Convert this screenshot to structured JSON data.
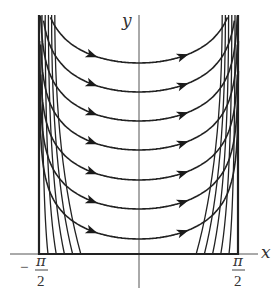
{
  "figure": {
    "type": "phase-portrait",
    "axes": {
      "x_label": "x",
      "y_label": "y",
      "x_ticks": [
        {
          "sign": "−",
          "numerator": "π",
          "denominator": "2",
          "value": "-pi/2"
        },
        {
          "sign": "",
          "numerator": "π",
          "denominator": "2",
          "value": "pi/2"
        }
      ]
    },
    "domain": {
      "x_min": "-pi/2",
      "x_max": "pi/2"
    },
    "curve_minima_y_px": [
      63,
      92,
      121,
      150,
      180,
      209,
      239
    ],
    "arrow_direction": "left-to-right",
    "colors": {
      "stroke": "#222222",
      "axis": "#444444",
      "label": "#333333"
    }
  }
}
